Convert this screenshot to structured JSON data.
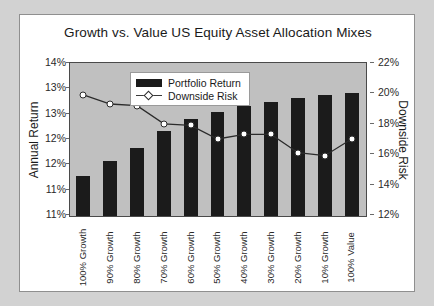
{
  "chart_data": {
    "type": "bar",
    "title": "Growth vs. Value US Equity Asset Allocation Mixes",
    "xlabel": "",
    "ylabel": "Annual Return",
    "y2label": "Downside Risk",
    "ylim": [
      11,
      14
    ],
    "y2lim": [
      12,
      22
    ],
    "grid": false,
    "legend_position": "top-left-inside",
    "categories": [
      "100% Growth",
      "90% Growth",
      "80% Growth",
      "70% Growth",
      "60% Growth",
      "50% Growth",
      "40% Growth",
      "30% Growth",
      "20% Growth",
      "10% Growth",
      "100% Value"
    ],
    "ytick_labels": [
      "14%",
      "13%",
      "13%",
      "12%",
      "12%",
      "11%",
      "11%"
    ],
    "ytick_values": [
      14.0,
      13.5,
      13.0,
      12.5,
      12.0,
      11.5,
      11.0
    ],
    "y2tick_labels": [
      "22%",
      "20%",
      "18%",
      "16%",
      "14%",
      "12%"
    ],
    "y2tick_values": [
      22,
      20,
      18,
      16,
      14,
      12
    ],
    "series": [
      {
        "name": "Portfolio Return",
        "kind": "bar",
        "axis": "left",
        "color": "#1b1b1b",
        "values": [
          11.78,
          12.08,
          12.35,
          12.68,
          12.92,
          13.05,
          13.18,
          13.25,
          13.32,
          13.38,
          13.42
        ]
      },
      {
        "name": "Downside Risk",
        "kind": "line",
        "axis": "right",
        "color": "#2b2b2b",
        "marker": "open-diamond",
        "values": [
          19.9,
          19.3,
          19.2,
          18.0,
          17.9,
          17.0,
          17.3,
          17.3,
          16.1,
          15.9,
          17.0
        ]
      }
    ]
  },
  "legend": {
    "items": [
      {
        "label": "Portfolio Return",
        "type": "swatch"
      },
      {
        "label": "Downside Risk",
        "type": "line-marker"
      }
    ]
  },
  "colors": {
    "plot_background": "#c0c0c0",
    "card_background": "#ffffff",
    "page_background": "#d2d2d2",
    "bar": "#1b1b1b",
    "line": "#2b2b2b",
    "axis": "#4a4a4a",
    "text": "#1a1a1a"
  }
}
